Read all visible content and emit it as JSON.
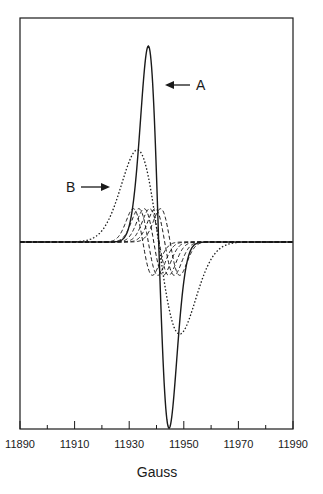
{
  "chart_data": {
    "type": "line",
    "title": "",
    "xlabel": "Gauss",
    "ylabel": "",
    "xlim": [
      11890,
      11990
    ],
    "x_ticks_major": [
      11890,
      11910,
      11930,
      11950,
      11970,
      11990
    ],
    "x_ticks_minor": [
      11900,
      11920,
      11940,
      11960,
      11980
    ],
    "x_tick_labels": [
      "11890",
      "11910",
      "11930",
      "11950",
      "11970",
      "11990"
    ],
    "grid": false,
    "legend": null,
    "series": [
      {
        "name": "A",
        "style": "solid",
        "shape": "derivative",
        "center": 11940.8,
        "peak_x": 11937,
        "trough_x": 11944.6,
        "peak_y": 1.0,
        "trough_y": -0.95
      },
      {
        "name": "B",
        "style": "dotted",
        "shape": "derivative",
        "center": 11941,
        "peak_x": 11933,
        "trough_x": 11948.5,
        "peak_y": 0.47,
        "trough_y": -0.47
      },
      {
        "name": "components",
        "style": "dashed",
        "shape": "derivative-family",
        "count": 6,
        "centers": [
          11935,
          11937,
          11939,
          11941,
          11943,
          11945
        ],
        "amplitude": 0.17
      }
    ],
    "annotations": [
      {
        "text": "A",
        "arrow": "left",
        "points_to": "series A peak"
      },
      {
        "text": "B",
        "arrow": "right",
        "points_to": "series B peak"
      }
    ]
  },
  "labels": {
    "xlabel": "Gauss",
    "annoA": "A",
    "annoB": "B",
    "ticks": [
      "11890",
      "11910",
      "11930",
      "11950",
      "11970",
      "11990"
    ]
  }
}
